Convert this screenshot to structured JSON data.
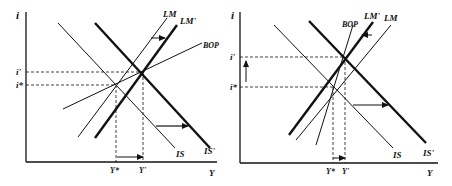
{
  "panels": [
    {
      "id": "left",
      "axes": {
        "y_label": "i",
        "x_label": "Y"
      },
      "curves": {
        "lm": "LM",
        "lm_prime": "LM'",
        "bop": "BOP",
        "is": "IS",
        "is_prime": "IS'"
      },
      "rate_labels": {
        "i_prime": "i'",
        "i_star": "i*"
      },
      "output_labels": {
        "y_star": "Y*",
        "y_prime": "Y'"
      }
    },
    {
      "id": "right",
      "axes": {
        "y_label": "i",
        "x_label": "Y"
      },
      "curves": {
        "lm": "LM",
        "lm_prime": "LM'",
        "bop": "BOP",
        "is": "IS",
        "is_prime": "IS'"
      },
      "rate_labels": {
        "i_prime": "i'",
        "i_star": "i*"
      },
      "output_labels": {
        "y_star": "Y*",
        "y_prime": "Y'"
      }
    }
  ],
  "colors": {
    "line": "#111111",
    "background": "#ffffff"
  }
}
